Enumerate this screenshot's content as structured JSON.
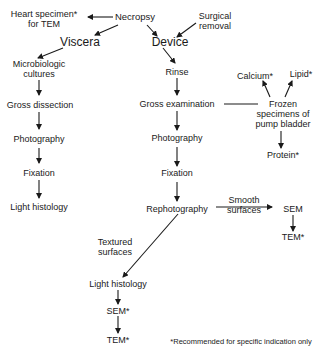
{
  "diagram": {
    "nodes": {
      "heart_specimen": {
        "line1": "Heart specimen*",
        "line2": "for TEM"
      },
      "necropsy": "Necropsy",
      "surgical_removal": {
        "line1": "Surgical",
        "line2": "removal"
      },
      "viscera": "Viscera",
      "device": "Device",
      "micro_cultures": {
        "line1": "Microbiologic",
        "line2": "cultures"
      },
      "gross_dissection": "Gross dissection",
      "left_photography": "Photography",
      "left_fixation": "Fixation",
      "left_light_histology": "Light histology",
      "rinse": "Rinse",
      "gross_examination": "Gross examination",
      "center_photography": "Photography",
      "center_fixation": "Fixation",
      "rephotography": "Rephotography",
      "calcium": "Calcium*",
      "lipid": "Lipid*",
      "frozen_specimens": {
        "line1": "Frozen",
        "line2": "specimens of",
        "line3": "pump bladder"
      },
      "protein": "Protein*",
      "smooth_surfaces": {
        "line1": "Smooth",
        "line2": "surfaces"
      },
      "right_sem": "SEM",
      "right_tem": "TEM*",
      "textured_surfaces": {
        "line1": "Textured",
        "line2": "surfaces"
      },
      "bottom_light_histology": "Light histology",
      "bottom_sem": "SEM*",
      "bottom_tem": "TEM*"
    },
    "footnote": "*Recommended for specific indication only",
    "colors": {
      "ink": "#1a1a1a",
      "background": "#ffffff"
    }
  }
}
